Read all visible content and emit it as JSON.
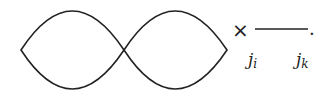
{
  "diagram": {
    "type": "feynman-like-diagram",
    "left_shape": {
      "kind": "lens",
      "label": ""
    },
    "right_shape": {
      "kind": "lens",
      "label": ""
    },
    "operator": "×",
    "propagator": {
      "start_label": "j",
      "start_sub": "i",
      "end_label": "j",
      "end_sub": "k"
    },
    "terminator": "."
  },
  "colors": {
    "stroke": "#222222",
    "background": "#ffffff"
  }
}
